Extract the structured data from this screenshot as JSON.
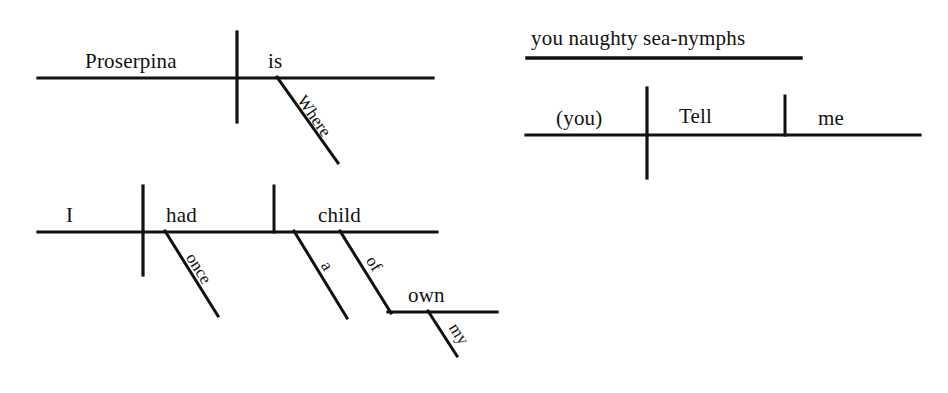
{
  "document": {
    "title": "Sentence diagrams",
    "background_color": "#ffffff",
    "ink_color": "#111111"
  },
  "diagrams": [
    {
      "id": "diagram-proserpina",
      "name": "where-is-proserpina",
      "sentence": "Where is Proserpina",
      "words": {
        "subject": "Proserpina",
        "verb": "is",
        "adverb": "Where"
      }
    },
    {
      "id": "diagram-i-had-child",
      "name": "i-had-a-child-of-my-own-once",
      "sentence": "I had a child of my own once",
      "words": {
        "subject": "I",
        "verb": "had",
        "object": "child",
        "adverb": "once",
        "article": "a",
        "preposition": "of",
        "prep_object": "own",
        "possessive": "my"
      }
    },
    {
      "id": "diagram-tell-me",
      "name": "tell-me-you-naughty-sea-nymphs",
      "sentence": "Tell me, you naughty sea-nymphs",
      "words": {
        "vocative": "you naughty sea-nymphs",
        "subject": "(you)",
        "verb": "Tell",
        "object": "me"
      }
    }
  ]
}
